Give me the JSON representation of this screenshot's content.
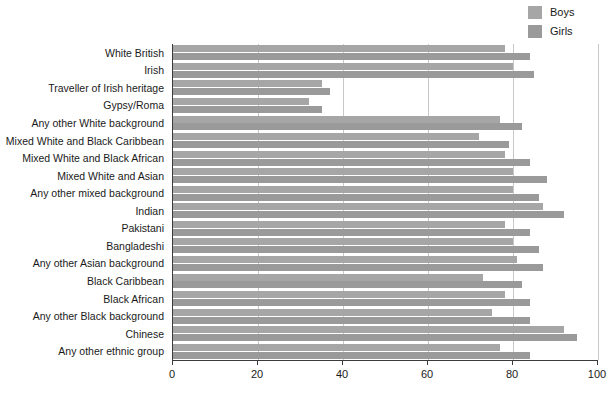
{
  "legend": {
    "position": "top-right",
    "items": [
      {
        "label": "Boys",
        "color": "#a6a6a6",
        "name": "legend-item-boys"
      },
      {
        "label": "Girls",
        "color": "#9a9a9a",
        "name": "legend-item-girls"
      }
    ]
  },
  "chart_data": {
    "type": "bar",
    "orientation": "horizontal",
    "title": "",
    "subtitle": "",
    "xlabel": "",
    "ylabel": "",
    "xlim": [
      0,
      100
    ],
    "xticks": [
      0,
      20,
      40,
      60,
      80,
      100
    ],
    "grid": true,
    "legend_position": "top-right",
    "categories": [
      "White British",
      "Irish",
      "Traveller of Irish heritage",
      "Gypsy/Roma",
      "Any other White background",
      "Mixed White and Black Caribbean",
      "Mixed White and Black African",
      "Mixed White and Asian",
      "Any other mixed background",
      "Indian",
      "Pakistani",
      "Bangladeshi",
      "Any other Asian background",
      "Black Caribbean",
      "Black African",
      "Any other Black background",
      "Chinese",
      "Any other ethnic group"
    ],
    "series": [
      {
        "name": "Boys",
        "color": "#a6a6a6",
        "values": [
          78,
          80,
          35,
          32,
          77,
          72,
          78,
          80,
          80,
          87,
          78,
          80,
          81,
          73,
          78,
          75,
          92,
          77
        ]
      },
      {
        "name": "Girls",
        "color": "#9a9a9a",
        "values": [
          84,
          85,
          37,
          35,
          82,
          79,
          84,
          88,
          86,
          92,
          84,
          86,
          87,
          82,
          84,
          84,
          95,
          84
        ]
      }
    ]
  },
  "colors": {
    "boys": "#a6a6a6",
    "girls": "#9a9a9a",
    "grid": "#c9c9c9",
    "axis": "#3b3b3b",
    "text": "#1a1a1a",
    "background": "#ffffff"
  }
}
